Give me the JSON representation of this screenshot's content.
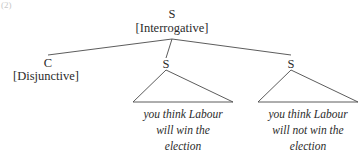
{
  "figure": {
    "example_number": "(2)",
    "line_color": "#4a4a4a",
    "text_color": "#2b2b2b",
    "background": "#ffffff"
  },
  "tree": {
    "root": {
      "category": "S",
      "feature": "[Interrogative]"
    },
    "children": [
      {
        "category": "C",
        "feature": "[Disjunctive]",
        "leaf_lines": []
      },
      {
        "category": "S",
        "feature": "",
        "leaf_lines": [
          "you think Labour",
          "will win the",
          "election"
        ]
      },
      {
        "category": "S",
        "feature": "",
        "leaf_lines": [
          "you think Labour",
          "will not win the",
          "election"
        ]
      }
    ]
  }
}
